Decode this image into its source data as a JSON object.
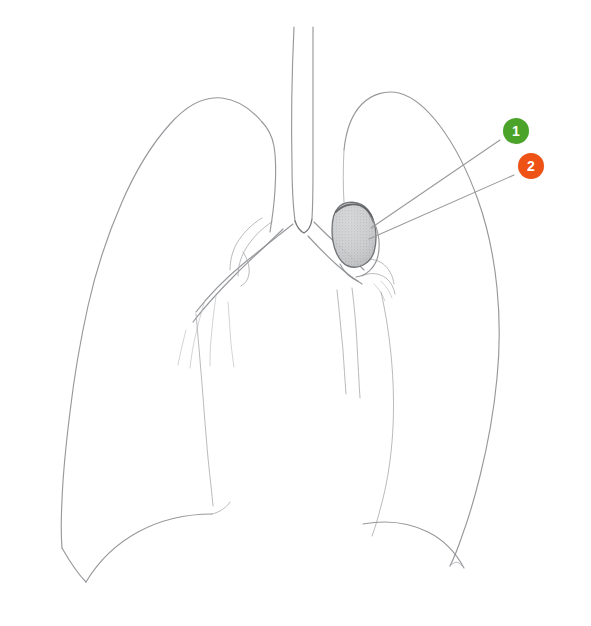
{
  "figure": {
    "background_color": "#ffffff",
    "width": 591,
    "height": 626,
    "sketch_line_color": "#8d8f93",
    "leader_line_color": "#9a9a9a"
  },
  "annotations": [
    {
      "id": "1",
      "label": "1",
      "color": "#4ca32a",
      "text_color": "#ffffff",
      "marker_x": 516,
      "marker_y": 131,
      "leader_start_x": 500,
      "leader_start_y": 140,
      "leader_end_x": 371,
      "leader_end_y": 228
    },
    {
      "id": "2",
      "label": "2",
      "color": "#ef5215",
      "text_color": "#ffffff",
      "marker_x": 531,
      "marker_y": 166,
      "leader_start_x": 514,
      "leader_start_y": 175,
      "leader_end_x": 369,
      "leader_end_y": 239
    }
  ],
  "structures": {
    "trachea": "trachea",
    "carina": "carina",
    "right_main_bronchus": "right-main-bronchus",
    "left_main_bronchus": "left-main-bronchus",
    "right_lung": "right-lung-outline",
    "left_lung": "left-lung-outline",
    "hilar_mass": "shaded-hilar-mass",
    "right_diaphragm": "right-diaphragm-curve",
    "left_diaphragm": "left-diaphragm-curve"
  }
}
